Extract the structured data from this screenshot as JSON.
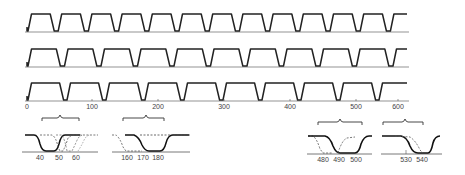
{
  "figure": {
    "traces": [
      {
        "name": "trace-1",
        "top_y": 14,
        "base_y": 31,
        "start_x": 27,
        "period": 30.2,
        "duty_high": 0.62,
        "count": 19
      },
      {
        "name": "trace-2",
        "top_y": 49,
        "base_y": 66,
        "start_x": 27,
        "period": 36.5,
        "duty_high": 0.68,
        "count": 16
      },
      {
        "name": "trace-3",
        "top_y": 83,
        "base_y": 100,
        "start_x": 27,
        "period": 39.0,
        "duty_high": 0.72,
        "count": 15
      }
    ],
    "axis": {
      "y": 107,
      "x_start": 27,
      "x_end": 407,
      "ticks": [
        {
          "label": "0",
          "x": 27
        },
        {
          "label": "100",
          "x": 92
        },
        {
          "label": "200",
          "x": 158
        },
        {
          "label": "300",
          "x": 224
        },
        {
          "label": "400",
          "x": 290
        },
        {
          "label": "500",
          "x": 356
        },
        {
          "label": "600",
          "x": 398
        }
      ]
    },
    "insets": [
      {
        "name": "inset-40-60",
        "ticks": [
          {
            "label": "40",
            "x": 40
          },
          {
            "label": "50",
            "x": 59
          },
          {
            "label": "60",
            "x": 76
          }
        ]
      },
      {
        "name": "inset-160-180",
        "ticks": [
          {
            "label": "160",
            "x": 127
          },
          {
            "label": "170",
            "x": 143
          },
          {
            "label": "180",
            "x": 158
          }
        ]
      },
      {
        "name": "inset-480-500",
        "ticks": [
          {
            "label": "480",
            "x": 323
          },
          {
            "label": "490",
            "x": 339
          },
          {
            "label": "500",
            "x": 356
          }
        ]
      },
      {
        "name": "inset-530-540",
        "ticks": [
          {
            "label": "530",
            "x": 406
          },
          {
            "label": "540",
            "x": 422
          }
        ]
      }
    ],
    "line_color": "#222222",
    "dash_color": "#555555"
  }
}
